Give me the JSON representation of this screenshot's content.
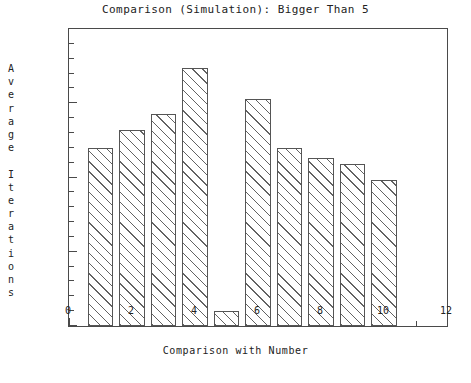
{
  "chart_data": {
    "type": "bar",
    "title": "Comparison (Simulation): Bigger Than 5",
    "xlabel": "Comparison with Number",
    "ylabel": "Average Iterations",
    "ylabel_chars": [
      "A",
      "v",
      "e",
      "r",
      "a",
      "g",
      "e",
      " ",
      "I",
      "t",
      "e",
      "r",
      "a",
      "t",
      "i",
      "o",
      "n",
      "s"
    ],
    "categories": [
      1,
      2,
      3,
      4,
      5,
      6,
      7,
      8,
      9,
      10
    ],
    "values": [
      12.0,
      13.2,
      14.3,
      17.4,
      1.0,
      15.3,
      12.0,
      11.3,
      10.9,
      9.8
    ],
    "xlim": [
      0,
      12
    ],
    "ylim": [
      0,
      20
    ],
    "x_ticks_major": [
      0,
      2,
      4,
      6,
      8,
      10,
      12
    ],
    "x_tick_labels": [
      "0",
      "2",
      "4",
      "6",
      "8",
      "10",
      "12"
    ],
    "x_ticks_minor": [
      1,
      3,
      5,
      7,
      9,
      11
    ],
    "y_ticks_major": [
      0,
      5,
      10,
      15,
      20
    ],
    "y_tick_labels": [
      "0",
      "5",
      "10",
      "15",
      "20"
    ],
    "y_ticks_minor": [
      1,
      2,
      3,
      4,
      6,
      7,
      8,
      9,
      11,
      12,
      13,
      14,
      16,
      17,
      18,
      19
    ],
    "grid": false,
    "legend": "none",
    "bar_width": 0.8,
    "bar_fill": "diagonal-hatch",
    "colors": {
      "axis": "#4a4a4a",
      "bar_edge": "#555555",
      "bar_hatch": "#5a5a5a",
      "background": "#ffffff",
      "text": "#222222"
    }
  }
}
